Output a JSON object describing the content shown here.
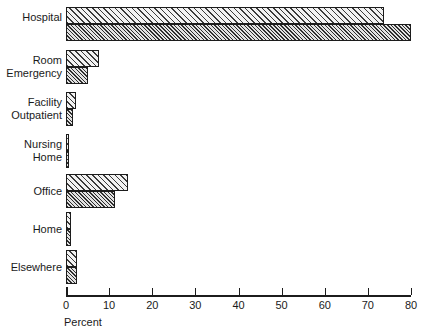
{
  "chart_data": {
    "type": "bar",
    "orientation": "horizontal",
    "title": "",
    "xlabel": "Percent",
    "ylabel": "",
    "xlim": [
      0,
      80
    ],
    "xticks": [
      0,
      10,
      20,
      30,
      40,
      50,
      60,
      70,
      80
    ],
    "xticklabels": [
      "0",
      "10",
      "20",
      "30",
      "40",
      "50",
      "60",
      "70",
      "80"
    ],
    "grid": false,
    "legend": "none",
    "categories": [
      "Hospital",
      "Room\nEmergency",
      "Facility\nOutpatient",
      "Nursing\nHome",
      "Office",
      "Home",
      "Elsewhere"
    ],
    "series": [
      {
        "name": "upper",
        "fill": "light-hatch",
        "values": [
          73.7,
          7.7,
          2.3,
          0.7,
          14.4,
          1.2,
          2.5
        ]
      },
      {
        "name": "lower",
        "fill": "dense-hatch",
        "values": [
          80.0,
          5.1,
          1.6,
          0.7,
          11.4,
          1.2,
          2.5
        ]
      }
    ]
  },
  "colors": {
    "axis": "#1c1c1c",
    "bar_outline": "#1c1c1c",
    "text": "#1a1a1a",
    "background": "#ffffff"
  },
  "axis_label": {
    "x": "Percent"
  }
}
